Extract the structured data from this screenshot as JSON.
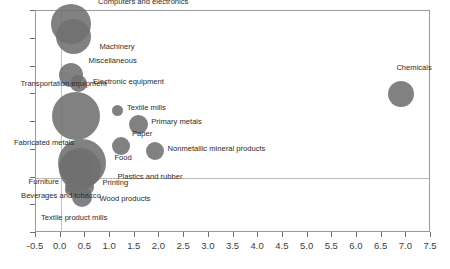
{
  "chart_data": {
    "type": "scatter",
    "title": "",
    "subtitle": "",
    "xlabel": "",
    "ylabel": "",
    "xlim": [
      -0.5,
      7.5
    ],
    "ylim": [
      -10,
      30
    ],
    "grid": true,
    "legend": false,
    "bubble_color": "#6f6f6f",
    "frame_color": "#9a9a9a",
    "gridline_color": "#b9b9b9",
    "xticks": [
      "-0.5",
      "0.0",
      "0.5",
      "1.0",
      "1.5",
      "2.0",
      "2.5",
      "3.0",
      "3.5",
      "4.0",
      "4.5",
      "5.0",
      "5.5",
      "6.0",
      "6.5",
      "7.0",
      "7.5"
    ],
    "xtick_values": [
      -0.5,
      0.0,
      0.5,
      1.0,
      1.5,
      2.0,
      2.5,
      3.0,
      3.5,
      4.0,
      4.5,
      5.0,
      5.5,
      6.0,
      6.5,
      7.0,
      7.5
    ],
    "yticks": [
      "30",
      "25",
      "20",
      "15",
      "10",
      "5",
      "0",
      "-5",
      "-10"
    ],
    "ytick_values": [
      30,
      25,
      20,
      15,
      10,
      5,
      0,
      -5,
      -10
    ],
    "gridlines_y": [
      0
    ],
    "gridlines_x": [
      0.0
    ],
    "points": [
      {
        "label": "Computers and electronics",
        "x": 0.21,
        "y": 27.6,
        "r": 20.0,
        "label_dx": 28,
        "label_dy": -20,
        "anchor": "left"
      },
      {
        "label": "Machinery",
        "x": 0.26,
        "y": 25.4,
        "r": 17.5,
        "label_dx": 27,
        "label_dy": 12,
        "anchor": "left"
      },
      {
        "label": "Miscellaneous",
        "x": 0.2,
        "y": 18.5,
        "r": 12.0,
        "label_dx": 19,
        "label_dy": -12,
        "anchor": "left"
      },
      {
        "label": "Electronic equipment",
        "x": 0.37,
        "y": 16.9,
        "r": 8.5,
        "label_dx": 15,
        "label_dy": 0,
        "anchor": "left"
      },
      {
        "label": "Transportation equipment",
        "x": 0.3,
        "y": 11.0,
        "r": 24.0,
        "label_dx": -54,
        "label_dy": -30,
        "anchor": "left"
      },
      {
        "label": "Textile mills",
        "x": 1.16,
        "y": 12.0,
        "r": 5.5,
        "label_dx": 10,
        "label_dy": -1,
        "anchor": "left"
      },
      {
        "label": "Primary metals",
        "x": 1.57,
        "y": 9.6,
        "r": 9.5,
        "label_dx": 14,
        "label_dy": 0,
        "anchor": "left"
      },
      {
        "label": "Paper",
        "x": 1.22,
        "y": 5.7,
        "r": 9.0,
        "label_dx": 12,
        "label_dy": -10,
        "anchor": "left"
      },
      {
        "label": "Nonmetallic mineral products",
        "x": 1.92,
        "y": 4.7,
        "r": 9.0,
        "label_dx": 13,
        "label_dy": 0,
        "anchor": "left"
      },
      {
        "label": "Chemicals",
        "x": 6.9,
        "y": 15.0,
        "r": 13.0,
        "label_dx": -4,
        "label_dy": -24,
        "anchor": "left"
      },
      {
        "label": "Food",
        "x": 0.44,
        "y": 2.7,
        "r": 24.0,
        "label_dx": 33,
        "label_dy": -3,
        "anchor": "left"
      },
      {
        "label": "Plastics and rubber",
        "x": 0.4,
        "y": 1.6,
        "r": 21.0,
        "label_dx": 38,
        "label_dy": 10,
        "anchor": "left"
      },
      {
        "label": "Fabricated metals",
        "x": 0.33,
        "y": 1.9,
        "r": 17.0,
        "label_dx": -62,
        "label_dy": -22,
        "anchor": "left"
      },
      {
        "label": "Furniture",
        "x": 0.22,
        "y": -1.6,
        "r": 7.0,
        "label_dx": -42,
        "label_dy": -2,
        "anchor": "left"
      },
      {
        "label": "Printing",
        "x": 0.5,
        "y": -1.7,
        "r": 9.0,
        "label_dx": 18,
        "label_dy": -2,
        "anchor": "left"
      },
      {
        "label": "Wood products",
        "x": 0.44,
        "y": -3.5,
        "r": 10.0,
        "label_dx": 18,
        "label_dy": 4,
        "anchor": "left"
      },
      {
        "label": "Beverages and tobacco",
        "x": 0.19,
        "y": -2.3,
        "r": 5.0,
        "label_dx": -48,
        "label_dy": 8,
        "anchor": "left"
      },
      {
        "label": "Textile product mills",
        "x": 0.27,
        "y": -2.9,
        "r": 4.0,
        "label_dx": -32,
        "label_dy": 26,
        "anchor": "left"
      }
    ]
  }
}
